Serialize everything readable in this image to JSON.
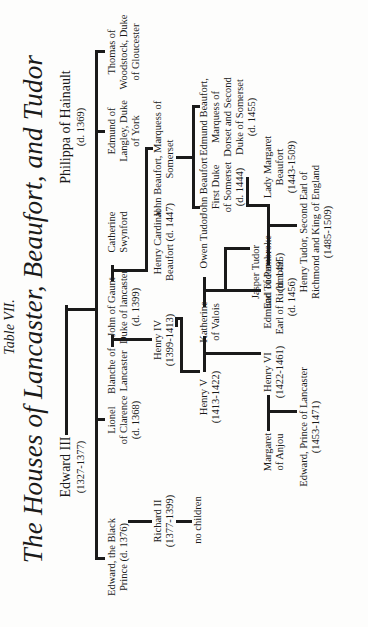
{
  "title": {
    "label": "Table VII.",
    "main": "The Houses of Lancaster, Beaufort, and Tudor"
  },
  "people": {
    "edward_iii": {
      "name": "Edward III",
      "dates": "(1327-1377)"
    },
    "philippa": {
      "name": "Philippa of Hainault",
      "dates": "(d. 1369)"
    },
    "black_prince": {
      "l1": "Edward, the Black",
      "l2": "Prince (d. 1376)"
    },
    "lionel": {
      "l1": "Lionel",
      "l2": "of Clarence",
      "l3": "(d. 1368)"
    },
    "blanche": {
      "l1": "Blanche of",
      "l2": "Lancaster"
    },
    "john_gaunt": {
      "l1": "John of Gaunt",
      "l2": "Duke of lancaster",
      "l3": "(d. 1399)"
    },
    "catherine_swynford": {
      "l1": "Catherine",
      "l2": "Swynford"
    },
    "edmund_langley": {
      "l1": "Edmund of",
      "l2": "Langley, Duke",
      "l3": "of York"
    },
    "thomas_woodstock": {
      "l1": "Thomas of",
      "l2": "Woodstock, Duke",
      "l3": "of Gloucester"
    },
    "richard_ii": {
      "l1": "Richard II",
      "l2": "(1377-1399)"
    },
    "no_children": {
      "l1": "no children"
    },
    "henry_iv": {
      "l1": "Henry IV",
      "l2": "(1399-1413)"
    },
    "henry_cardinal": {
      "l1": "Henry Cardinal",
      "l2": "Beaufort (d. 1447)"
    },
    "john_beaufort_marquess": {
      "l1": "John Beaufort, Marquess of",
      "l2": "Somerset"
    },
    "henry_v": {
      "l1": "Henry V",
      "l2": "(1413-1422)"
    },
    "katherine_valois": {
      "l1": "Katherine",
      "l2": "of Valois"
    },
    "owen_tudor": {
      "l1": "Owen Tudor"
    },
    "john_beaufort_duke": {
      "l1": "John Beaufort",
      "l2": "First Duke",
      "l3": "of Somerset",
      "l4": "(d. 1444)"
    },
    "edmund_beaufort": {
      "l1": "Edmund Beaufort,",
      "l2": "Marquess of",
      "l3": "Dorset and Second",
      "l4": "Duke of Somerset",
      "l5": "(d. 1455)"
    },
    "margaret_anjou": {
      "l1": "Margaret",
      "l2": "of Anjou"
    },
    "henry_vi": {
      "l1": "Henry VI",
      "l2": "(1422-1461)"
    },
    "edmund_tudor": {
      "l1": "Edmund Tudor",
      "l2": "Earl of Richmond",
      "l3": "(d. 1456)"
    },
    "jasper_tudor": {
      "l1": "Jasper Tudor",
      "l2": "Earl of Pembroke",
      "l3": "(d. 1495)"
    },
    "lady_margaret": {
      "l1": "Lady Margaret",
      "l2": "Beaufort",
      "l3": "(1443-1509)"
    },
    "edward_prince": {
      "l1": "Edward, Prince of Lancaster",
      "l2": "(1453-1471)"
    },
    "henry_tudor": {
      "l1": "Henry Tudor, Second Earl of",
      "l2": "Richmond and King of England",
      "l3": "(1485-1509)"
    }
  },
  "colors": {
    "ink": "#1a1a1a",
    "paper": "#fdfdfc"
  }
}
